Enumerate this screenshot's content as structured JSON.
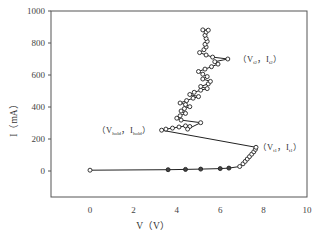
{
  "chart_data": {
    "type": "line",
    "title": "",
    "xlabel": "V（V）",
    "ylabel": "I（mA）",
    "xlim": [
      -2.8,
      10
    ],
    "ylim": [
      -160,
      1000
    ],
    "xticks": [
      0,
      2,
      4,
      6,
      8,
      10
    ],
    "yticks": [
      0,
      200,
      400,
      600,
      800,
      1000
    ],
    "xtick_labels": [
      "0",
      "2",
      "4",
      "6",
      "8",
      "10"
    ],
    "ytick_labels": [
      "0",
      "200",
      "400",
      "600",
      "800",
      "1000"
    ],
    "grid": false,
    "legend": null,
    "series": [
      {
        "name": "I-V (TLP)",
        "marker": "circle",
        "points": [
          [
            0.0,
            5
          ],
          [
            3.6,
            8
          ],
          [
            4.4,
            10
          ],
          [
            5.1,
            12
          ],
          [
            6.0,
            15
          ],
          [
            6.4,
            18
          ],
          [
            6.9,
            28
          ],
          [
            7.05,
            45
          ],
          [
            7.15,
            60
          ],
          [
            7.25,
            75
          ],
          [
            7.35,
            90
          ],
          [
            7.45,
            105
          ],
          [
            7.55,
            120
          ],
          [
            7.62,
            135
          ],
          [
            7.65,
            148
          ],
          [
            3.3,
            255
          ],
          [
            3.5,
            262
          ],
          [
            3.8,
            268
          ],
          [
            4.1,
            275
          ],
          [
            4.4,
            282
          ],
          [
            4.6,
            278
          ],
          [
            4.5,
            262
          ],
          [
            5.1,
            302
          ],
          [
            4.2,
            318
          ],
          [
            4.0,
            330
          ],
          [
            4.15,
            345
          ],
          [
            4.4,
            360
          ],
          [
            4.2,
            375
          ],
          [
            4.35,
            390
          ],
          [
            4.6,
            402
          ],
          [
            4.4,
            415
          ],
          [
            4.15,
            425
          ],
          [
            4.45,
            440
          ],
          [
            4.75,
            455
          ],
          [
            5.0,
            465
          ],
          [
            4.6,
            478
          ],
          [
            4.8,
            492
          ],
          [
            5.1,
            505
          ],
          [
            5.4,
            515
          ],
          [
            5.1,
            528
          ],
          [
            5.45,
            545
          ],
          [
            5.55,
            560
          ],
          [
            5.2,
            575
          ],
          [
            5.4,
            590
          ],
          [
            5.2,
            605
          ],
          [
            5.0,
            622
          ],
          [
            5.3,
            637
          ],
          [
            5.6,
            652
          ],
          [
            5.9,
            668
          ],
          [
            5.75,
            683
          ],
          [
            6.35,
            700
          ],
          [
            5.65,
            712
          ],
          [
            5.35,
            725
          ],
          [
            5.05,
            740
          ],
          [
            5.25,
            758
          ],
          [
            5.35,
            775
          ],
          [
            5.3,
            792
          ],
          [
            5.4,
            810
          ],
          [
            5.35,
            828
          ],
          [
            5.3,
            848
          ],
          [
            5.35,
            868
          ],
          [
            5.2,
            882
          ],
          [
            5.45,
            880
          ]
        ]
      }
    ],
    "annotations": [
      {
        "text": "(V_hold, I_hold)",
        "main_parts": [
          "（V",
          "，I",
          "）"
        ],
        "subs": [
          "hold",
          "hold"
        ],
        "at": [
          3.3,
          255
        ]
      },
      {
        "text": "(V_t1, I_t1)",
        "main_parts": [
          "（V",
          "，I",
          "）"
        ],
        "subs": [
          "t1",
          "t1"
        ],
        "at": [
          7.65,
          148
        ]
      },
      {
        "text": "(V_t2, I_t2)",
        "main_parts": [
          "（V",
          "，I",
          "）"
        ],
        "subs": [
          "t2",
          "t2"
        ],
        "at": [
          6.35,
          700
        ]
      }
    ],
    "colors": {
      "line": "#222222",
      "marker_face": "#ffffff",
      "axes": "#555555"
    }
  }
}
